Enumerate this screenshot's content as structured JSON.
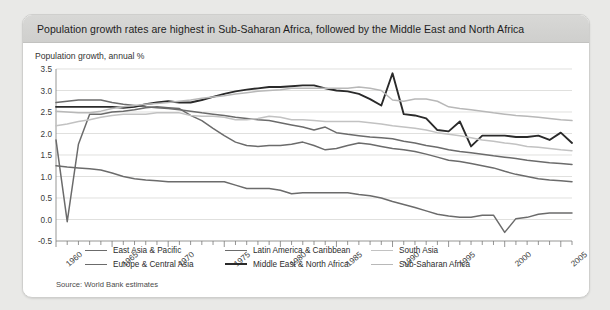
{
  "card": {
    "title": "Population growth rates are highest in Sub-Saharan Africa, followed by the Middle East and North Africa",
    "source": "Source: World Bank estimates"
  },
  "colors": {
    "background": "#e9e9e7",
    "card": "#ffffff",
    "titlebar": "#d4d4d2",
    "grid": "#d2d2d0",
    "axis": "#8a8a88"
  },
  "chart_data": {
    "type": "line",
    "title": "Population growth, annual %",
    "xlabel": "",
    "ylabel": "Population growth, annual %",
    "ylim": [
      -0.5,
      3.5
    ],
    "ytick_values": [
      -0.5,
      0.0,
      0.5,
      1.0,
      1.5,
      2.0,
      2.5,
      3.0,
      3.5
    ],
    "ytick_labels": [
      "-0.5",
      "0.0",
      "0.5",
      "1.0",
      "1.5",
      "2.0",
      "2.5",
      "3.0",
      "3.5"
    ],
    "xlim": [
      1960,
      2006
    ],
    "xtick_labels": [
      "1960",
      "1965",
      "1970",
      "1975",
      "1980",
      "1985",
      "1990",
      "1995",
      "2000",
      "2005"
    ],
    "xtick_values": [
      1960,
      1965,
      1970,
      1975,
      1980,
      1985,
      1990,
      1995,
      2000,
      2005
    ],
    "minor_xticks_every": 1,
    "grid": "horizontal",
    "legend_position": "inside-bottom",
    "x": [
      1960,
      1961,
      1962,
      1963,
      1964,
      1965,
      1966,
      1967,
      1968,
      1969,
      1970,
      1971,
      1972,
      1973,
      1974,
      1975,
      1976,
      1977,
      1978,
      1979,
      1980,
      1981,
      1982,
      1983,
      1984,
      1985,
      1986,
      1987,
      1988,
      1989,
      1990,
      1991,
      1992,
      1993,
      1994,
      1995,
      1996,
      1997,
      1998,
      1999,
      2000,
      2001,
      2002,
      2003,
      2004,
      2005,
      2006
    ],
    "series": [
      {
        "name": "East Asia & Pacific",
        "color": "#6b6b6b",
        "width": 1.5,
        "values": [
          1.85,
          -0.05,
          1.75,
          2.45,
          2.45,
          2.5,
          2.52,
          2.55,
          2.6,
          2.62,
          2.6,
          2.58,
          2.42,
          2.3,
          2.12,
          1.95,
          1.8,
          1.72,
          1.7,
          1.72,
          1.72,
          1.75,
          1.8,
          1.72,
          1.62,
          1.65,
          1.72,
          1.78,
          1.75,
          1.7,
          1.65,
          1.62,
          1.58,
          1.52,
          1.45,
          1.38,
          1.35,
          1.3,
          1.25,
          1.2,
          1.12,
          1.05,
          1.0,
          0.95,
          0.92,
          0.9,
          0.88
        ]
      },
      {
        "name": "Europe & Central Asia",
        "color": "#6b6b6b",
        "width": 1.5,
        "values": [
          1.25,
          1.22,
          1.2,
          1.18,
          1.15,
          1.08,
          1.0,
          0.95,
          0.92,
          0.9,
          0.88,
          0.88,
          0.88,
          0.88,
          0.88,
          0.88,
          0.8,
          0.72,
          0.72,
          0.72,
          0.68,
          0.6,
          0.62,
          0.62,
          0.62,
          0.62,
          0.62,
          0.58,
          0.55,
          0.5,
          0.42,
          0.35,
          0.28,
          0.2,
          0.12,
          0.08,
          0.05,
          0.05,
          0.1,
          0.1,
          -0.3,
          0.02,
          0.05,
          0.12,
          0.15,
          0.15,
          0.15
        ]
      },
      {
        "name": "Latin America & Caribbean",
        "color": "#6b6b6b",
        "width": 1.5,
        "values": [
          2.72,
          2.75,
          2.78,
          2.78,
          2.78,
          2.72,
          2.68,
          2.65,
          2.62,
          2.6,
          2.58,
          2.55,
          2.52,
          2.48,
          2.45,
          2.42,
          2.38,
          2.35,
          2.32,
          2.3,
          2.25,
          2.2,
          2.15,
          2.08,
          2.15,
          2.02,
          1.98,
          1.95,
          1.92,
          1.9,
          1.88,
          1.82,
          1.78,
          1.72,
          1.68,
          1.62,
          1.58,
          1.55,
          1.52,
          1.48,
          1.45,
          1.42,
          1.38,
          1.35,
          1.32,
          1.3,
          1.28
        ]
      },
      {
        "name": "Middle East & North Africa",
        "color": "#2a2a2a",
        "width": 1.9,
        "values": [
          2.62,
          2.62,
          2.62,
          2.62,
          2.62,
          2.62,
          2.6,
          2.62,
          2.68,
          2.72,
          2.75,
          2.72,
          2.72,
          2.78,
          2.85,
          2.92,
          2.98,
          3.02,
          3.05,
          3.08,
          3.08,
          3.1,
          3.12,
          3.12,
          3.05,
          3.0,
          2.98,
          2.92,
          2.8,
          2.65,
          3.4,
          2.45,
          2.42,
          2.35,
          2.08,
          2.05,
          2.28,
          1.7,
          1.95,
          1.95,
          1.95,
          1.92,
          1.92,
          1.95,
          1.85,
          2.02,
          1.78
        ]
      },
      {
        "name": "South Asia",
        "color": "#c2c2c2",
        "width": 1.5,
        "values": [
          2.18,
          2.22,
          2.28,
          2.32,
          2.38,
          2.42,
          2.45,
          2.45,
          2.45,
          2.48,
          2.48,
          2.48,
          2.42,
          2.4,
          2.4,
          2.38,
          2.32,
          2.32,
          2.35,
          2.4,
          2.38,
          2.32,
          2.32,
          2.3,
          2.28,
          2.28,
          2.28,
          2.28,
          2.25,
          2.22,
          2.18,
          2.15,
          2.12,
          2.08,
          2.02,
          1.98,
          1.95,
          1.9,
          1.85,
          1.82,
          1.78,
          1.75,
          1.7,
          1.68,
          1.65,
          1.62,
          1.6
        ]
      },
      {
        "name": "Sub-Saharan Africa",
        "color": "#b8b8b8",
        "width": 1.5,
        "values": [
          2.52,
          2.5,
          2.48,
          2.48,
          2.52,
          2.58,
          2.62,
          2.65,
          2.68,
          2.7,
          2.72,
          2.75,
          2.78,
          2.82,
          2.85,
          2.88,
          2.92,
          2.95,
          2.98,
          3.0,
          3.02,
          3.05,
          3.05,
          3.05,
          3.05,
          3.05,
          3.05,
          3.08,
          3.05,
          3.0,
          2.78,
          2.75,
          2.8,
          2.8,
          2.75,
          2.62,
          2.58,
          2.55,
          2.52,
          2.48,
          2.45,
          2.42,
          2.4,
          2.38,
          2.35,
          2.32,
          2.3
        ]
      }
    ],
    "legend": [
      {
        "name": "East Asia & Pacific",
        "color": "#6b6b6b"
      },
      {
        "name": "Latin America & Caribbean",
        "color": "#6b6b6b"
      },
      {
        "name": "South Asia",
        "color": "#c2c2c2"
      },
      {
        "name": "Europe & Central Asia",
        "color": "#6b6b6b"
      },
      {
        "name": "Middle East & North Africa",
        "color": "#2a2a2a"
      },
      {
        "name": "Sub-Saharan Africa",
        "color": "#b8b8b8"
      }
    ]
  }
}
